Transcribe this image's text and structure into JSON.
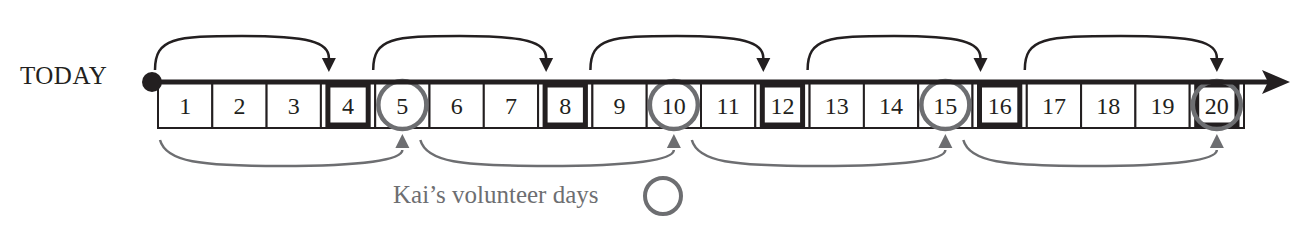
{
  "labels": {
    "today": "TODAY",
    "legend": "Kai’s volunteer days"
  },
  "colors": {
    "ink": "#231f20",
    "gray": "#6d6e71",
    "background": "#ffffff"
  },
  "timeline": {
    "days": [
      1,
      2,
      3,
      4,
      5,
      6,
      7,
      8,
      9,
      10,
      11,
      12,
      13,
      14,
      15,
      16,
      17,
      18,
      19,
      20
    ],
    "square_days": [
      4,
      8,
      12,
      16,
      20
    ],
    "square_interval": 4,
    "circle_days": [
      5,
      10,
      15,
      20
    ],
    "circle_interval": 5,
    "top_arcs": [
      [
        0,
        4
      ],
      [
        4,
        8
      ],
      [
        8,
        12
      ],
      [
        12,
        16
      ],
      [
        16,
        20
      ]
    ],
    "bottom_arcs": [
      [
        0,
        5
      ],
      [
        5,
        10
      ],
      [
        10,
        15
      ],
      [
        15,
        20
      ]
    ]
  }
}
